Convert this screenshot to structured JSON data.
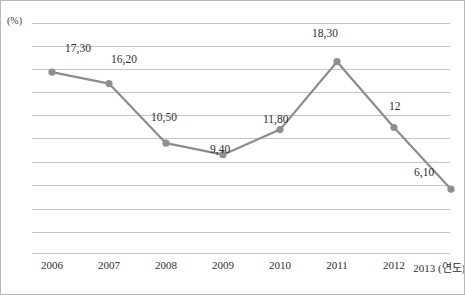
{
  "chart_data": {
    "type": "line",
    "title": "",
    "xlabel": "(연도)",
    "ylabel": "(%)",
    "categories": [
      "2006",
      "2007",
      "2008",
      "2009",
      "2010",
      "2011",
      "2012",
      "2013"
    ],
    "values": [
      17.3,
      16.2,
      10.5,
      9.4,
      11.8,
      18.3,
      12.0,
      6.1
    ],
    "point_labels": [
      "17,30",
      "16,20",
      "10,50",
      "9,40",
      "11,80",
      "18,30",
      "12",
      "6,10"
    ],
    "series": [
      {
        "name": "",
        "values": [
          17.3,
          16.2,
          10.5,
          9.4,
          11.8,
          18.3,
          12.0,
          6.1
        ],
        "color": "#8c8c8c"
      }
    ],
    "ylim": [
      0,
      22
    ],
    "grid": true,
    "gridline_count": 11,
    "legend": "none",
    "marker": "circle",
    "marker_color": "#8f8f8f",
    "line_color": "#8c8c8c",
    "gridline_color": "#c6c6c6",
    "border_color": "#b9b9b9",
    "decimal_separator": ","
  },
  "axes": {
    "y_unit_label": "(%)",
    "x_unit_label": "(연도)",
    "x_last_tick_full": "2013 (연도)"
  }
}
